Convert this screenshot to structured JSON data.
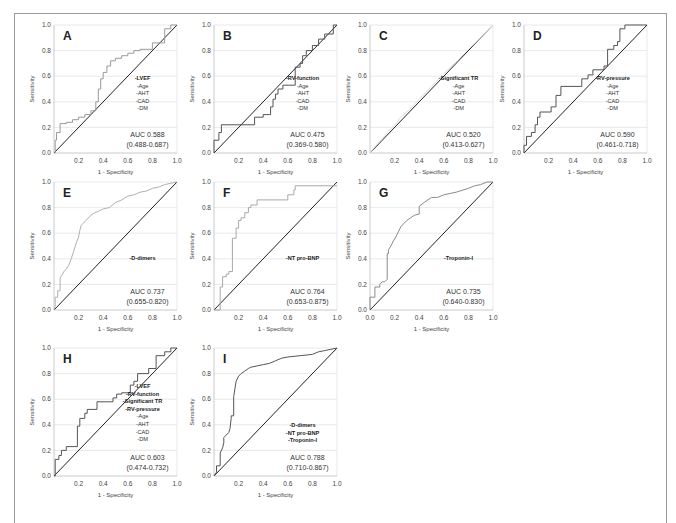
{
  "chart_data": [
    {
      "panel": "A",
      "type": "line",
      "xlabel": "1 - Specificity",
      "ylabel": "Sensitivity",
      "xticks": [
        "0.2",
        "0.4",
        "0.6",
        "0.8",
        "1.0"
      ],
      "yticks": [
        "0.0",
        "0.2",
        "0.4",
        "0.6",
        "0.8",
        "1.0"
      ],
      "xlim": [
        0,
        1
      ],
      "ylim": [
        0,
        1
      ],
      "grid": true,
      "legend": [
        {
          "text": "-LVEF",
          "bold": true
        },
        {
          "text": "-Age"
        },
        {
          "text": "-AHT"
        },
        {
          "text": "-CAD"
        },
        {
          "text": "-DM"
        }
      ],
      "auc": "AUC 0.588",
      "ci": "(0.488-0.687)",
      "curve_color": "#9a9a9a",
      "x": [
        0,
        0.01,
        0.01,
        0.02,
        0.02,
        0.05,
        0.05,
        0.1,
        0.1,
        0.15,
        0.15,
        0.2,
        0.2,
        0.25,
        0.25,
        0.3,
        0.3,
        0.34,
        0.34,
        0.36,
        0.36,
        0.38,
        0.38,
        0.4,
        0.4,
        0.43,
        0.43,
        0.46,
        0.46,
        0.5,
        0.5,
        0.55,
        0.55,
        0.6,
        0.6,
        0.65,
        0.65,
        0.7,
        0.7,
        0.8,
        0.8,
        0.9,
        0.9,
        0.95,
        0.95,
        1.0
      ],
      "y": [
        0,
        0,
        0.1,
        0.1,
        0.16,
        0.16,
        0.23,
        0.23,
        0.24,
        0.24,
        0.26,
        0.26,
        0.28,
        0.28,
        0.3,
        0.3,
        0.33,
        0.33,
        0.4,
        0.4,
        0.5,
        0.5,
        0.58,
        0.58,
        0.63,
        0.63,
        0.68,
        0.68,
        0.72,
        0.72,
        0.74,
        0.74,
        0.76,
        0.76,
        0.78,
        0.78,
        0.8,
        0.8,
        0.81,
        0.81,
        0.86,
        0.86,
        0.97,
        0.97,
        1.0,
        1.0
      ]
    },
    {
      "panel": "B",
      "type": "line",
      "xlabel": "1 - Specificity",
      "ylabel": "Sensitivity",
      "xticks": [
        "0.2",
        "0.4",
        "0.6",
        "0.8",
        "1.0"
      ],
      "yticks": [
        "0.0",
        "0.2",
        "0.4",
        "0.6",
        "0.8",
        "1.0"
      ],
      "xlim": [
        0,
        1
      ],
      "ylim": [
        0,
        1
      ],
      "grid": true,
      "legend": [
        {
          "text": "-RV-function",
          "bold": true
        },
        {
          "text": "-Age"
        },
        {
          "text": "-AHT"
        },
        {
          "text": "-CAD"
        },
        {
          "text": "-DM"
        }
      ],
      "auc": "AUC 0.475",
      "ci": "(0.369-0.580)",
      "curve_color": "#555555",
      "x": [
        0,
        0,
        0.04,
        0.04,
        0.06,
        0.06,
        0.33,
        0.33,
        0.4,
        0.4,
        0.46,
        0.46,
        0.48,
        0.48,
        0.5,
        0.5,
        0.52,
        0.52,
        0.56,
        0.56,
        0.66,
        0.66,
        0.7,
        0.7,
        0.72,
        0.72,
        0.75,
        0.75,
        0.8,
        0.8,
        0.85,
        0.85,
        0.9,
        0.9,
        0.97,
        0.97,
        1.0
      ],
      "y": [
        0,
        0.1,
        0.1,
        0.16,
        0.16,
        0.22,
        0.22,
        0.28,
        0.28,
        0.3,
        0.3,
        0.36,
        0.36,
        0.42,
        0.42,
        0.46,
        0.46,
        0.5,
        0.5,
        0.53,
        0.53,
        0.67,
        0.67,
        0.7,
        0.7,
        0.76,
        0.76,
        0.8,
        0.8,
        0.84,
        0.84,
        0.89,
        0.89,
        0.93,
        0.93,
        1.0,
        1.0
      ]
    },
    {
      "panel": "C",
      "type": "line",
      "xlabel": "1 - Specificity",
      "ylabel": "Sensitivity",
      "xticks": [
        "0.2",
        "0.4",
        "0.6",
        "0.8",
        "1.0"
      ],
      "yticks": [
        "0.0",
        "0.2",
        "0.4",
        "0.6",
        "0.8",
        "1.0"
      ],
      "xlim": [
        0,
        1
      ],
      "ylim": [
        0,
        1
      ],
      "grid": true,
      "legend": [
        {
          "text": "-Significant TR",
          "bold": true
        },
        {
          "text": "-Age"
        },
        {
          "text": "-AHT"
        },
        {
          "text": "-CAD"
        },
        {
          "text": "-DM"
        }
      ],
      "auc": "AUC 0.520",
      "ci": "(0.413-0.627)",
      "curve_color": "#dcdcdc",
      "x": [
        0,
        0.05,
        0.1,
        0.15,
        0.2,
        0.25,
        0.3,
        0.35,
        0.4,
        0.5,
        0.6,
        0.7,
        0.8,
        0.9,
        1.0
      ],
      "y": [
        0,
        0.06,
        0.11,
        0.17,
        0.22,
        0.28,
        0.32,
        0.37,
        0.42,
        0.52,
        0.62,
        0.71,
        0.81,
        0.9,
        1.0
      ]
    },
    {
      "panel": "D",
      "type": "line",
      "xlabel": "1 - Specificity",
      "ylabel": "Sensitivity",
      "xticks": [
        "0.2",
        "0.4",
        "0.6",
        "0.8",
        "1.0"
      ],
      "yticks": [
        "0.0",
        "0.2",
        "0.4",
        "0.6",
        "0.8",
        "1.0"
      ],
      "xlim": [
        0,
        1
      ],
      "ylim": [
        0,
        1
      ],
      "grid": true,
      "legend": [
        {
          "text": "-RV-pressure",
          "bold": true
        },
        {
          "text": "-Age"
        },
        {
          "text": "-AHT"
        },
        {
          "text": "-CAD"
        },
        {
          "text": "-DM"
        }
      ],
      "auc": "AUC 0.590",
      "ci": "(0.461-0.718)",
      "curve_color": "#555555",
      "x": [
        0,
        0,
        0.02,
        0.02,
        0.06,
        0.06,
        0.09,
        0.09,
        0.11,
        0.11,
        0.13,
        0.13,
        0.22,
        0.22,
        0.26,
        0.26,
        0.3,
        0.3,
        0.47,
        0.47,
        0.52,
        0.52,
        0.56,
        0.56,
        0.65,
        0.65,
        0.68,
        0.68,
        0.73,
        0.73,
        0.76,
        0.76,
        0.78,
        0.78,
        0.82,
        0.82,
        0.97,
        0.97,
        1.0
      ],
      "y": [
        0,
        0.06,
        0.06,
        0.13,
        0.13,
        0.16,
        0.16,
        0.22,
        0.22,
        0.28,
        0.28,
        0.32,
        0.32,
        0.36,
        0.36,
        0.45,
        0.45,
        0.52,
        0.52,
        0.58,
        0.58,
        0.61,
        0.61,
        0.65,
        0.65,
        0.68,
        0.68,
        0.81,
        0.81,
        0.84,
        0.84,
        0.87,
        0.87,
        0.97,
        0.97,
        1.0,
        1.0,
        1.0,
        1.0
      ]
    },
    {
      "panel": "E",
      "type": "line",
      "xlabel": "1 - Specificity",
      "ylabel": "Sensitivity",
      "xticks": [
        "0.2",
        "0.4",
        "0.6",
        "0.8",
        "1.0"
      ],
      "yticks": [
        "0.0",
        "0.2",
        "0.4",
        "0.6",
        "0.8",
        "1.0"
      ],
      "xlim": [
        0,
        1
      ],
      "ylim": [
        0,
        1
      ],
      "grid": true,
      "legend": [
        {
          "text": "-D-dimers",
          "bold": true
        }
      ],
      "auc": "AUC 0.737",
      "ci": "(0.655-0.820)",
      "curve_color": "#b0b0b0",
      "x": [
        0,
        0.01,
        0.01,
        0.03,
        0.03,
        0.05,
        0.05,
        0.07,
        0.08,
        0.1,
        0.12,
        0.14,
        0.16,
        0.18,
        0.2,
        0.21,
        0.22,
        0.24,
        0.26,
        0.3,
        0.33,
        0.36,
        0.4,
        0.45,
        0.5,
        0.55,
        0.6,
        0.65,
        0.7,
        0.75,
        0.8,
        0.85,
        0.9,
        0.95,
        1.0
      ],
      "y": [
        0,
        0.03,
        0.1,
        0.1,
        0.15,
        0.15,
        0.25,
        0.28,
        0.3,
        0.32,
        0.35,
        0.4,
        0.46,
        0.52,
        0.57,
        0.62,
        0.66,
        0.68,
        0.7,
        0.74,
        0.76,
        0.77,
        0.79,
        0.8,
        0.84,
        0.86,
        0.89,
        0.9,
        0.92,
        0.93,
        0.95,
        0.96,
        0.98,
        0.99,
        1.0
      ]
    },
    {
      "panel": "F",
      "type": "line",
      "xlabel": "1 - Specificity",
      "ylabel": "Sensitivity",
      "xticks": [
        "0.2",
        "0.4",
        "0.6",
        "0.8",
        "1.0"
      ],
      "yticks": [
        "0.0",
        "0.2",
        "0.4",
        "0.6",
        "0.8",
        "1.0"
      ],
      "xlim": [
        0,
        1
      ],
      "ylim": [
        0,
        1
      ],
      "grid": true,
      "legend": [
        {
          "text": "-NT pro-BNP",
          "bold": true
        }
      ],
      "auc": "AUC 0.764",
      "ci": "(0.653-0.875)",
      "curve_color": "#a8a8a8",
      "x": [
        0,
        0.05,
        0.05,
        0.07,
        0.07,
        0.1,
        0.1,
        0.12,
        0.12,
        0.15,
        0.15,
        0.18,
        0.18,
        0.2,
        0.2,
        0.22,
        0.22,
        0.25,
        0.25,
        0.28,
        0.28,
        0.3,
        0.3,
        0.35,
        0.35,
        0.6,
        0.6,
        0.65,
        0.65,
        0.66,
        0.66,
        1.0
      ],
      "y": [
        0,
        0,
        0.18,
        0.18,
        0.26,
        0.26,
        0.28,
        0.28,
        0.3,
        0.3,
        0.56,
        0.56,
        0.64,
        0.64,
        0.7,
        0.7,
        0.72,
        0.72,
        0.76,
        0.76,
        0.8,
        0.8,
        0.82,
        0.82,
        0.86,
        0.86,
        0.9,
        0.9,
        0.94,
        0.94,
        0.97,
        0.97
      ]
    },
    {
      "panel": "G",
      "type": "line",
      "xlabel": "1 - Specificity",
      "ylabel": "Sensitivity",
      "xticks": [
        "0.0",
        "0.2",
        "0.4",
        "0.6",
        "0.8",
        "1.0"
      ],
      "yticks": [
        "0.0",
        "0.2",
        "0.4",
        "0.6",
        "0.8",
        "1.0"
      ],
      "xlim": [
        0,
        1
      ],
      "ylim": [
        0,
        1
      ],
      "grid": true,
      "legend": [
        {
          "text": "-Troponin-I",
          "bold": true
        }
      ],
      "auc": "AUC 0.735",
      "ci": "(0.640-0.830)",
      "curve_color": "#8a8a8a",
      "x": [
        0,
        0,
        0.04,
        0.04,
        0.08,
        0.08,
        0.1,
        0.12,
        0.14,
        0.14,
        0.15,
        0.15,
        0.17,
        0.19,
        0.21,
        0.23,
        0.25,
        0.27,
        0.3,
        0.33,
        0.36,
        0.4,
        0.4,
        0.44,
        0.5,
        0.55,
        0.6,
        0.65,
        0.7,
        0.8,
        0.85,
        0.9,
        0.95,
        1.0
      ],
      "y": [
        0,
        0.1,
        0.1,
        0.18,
        0.18,
        0.2,
        0.22,
        0.22,
        0.24,
        0.44,
        0.44,
        0.47,
        0.5,
        0.54,
        0.57,
        0.61,
        0.65,
        0.67,
        0.7,
        0.72,
        0.74,
        0.75,
        0.81,
        0.84,
        0.88,
        0.88,
        0.9,
        0.91,
        0.92,
        0.95,
        0.97,
        0.98,
        1.0,
        1.0
      ]
    },
    {
      "panel": "H",
      "type": "line",
      "xlabel": "1 - Specificity",
      "ylabel": "Sensitivity",
      "xticks": [
        "0.2",
        "0.4",
        "0.6",
        "0.8",
        "1.0"
      ],
      "yticks": [
        "0.0",
        "0.2",
        "0.4",
        "0.6",
        "0.8",
        "1.0"
      ],
      "xlim": [
        0,
        1
      ],
      "ylim": [
        0,
        1
      ],
      "grid": true,
      "legend": [
        {
          "text": "-LVEF",
          "bold": true
        },
        {
          "text": "-RV-function",
          "bold": true
        },
        {
          "text": "-Significant TR",
          "bold": true
        },
        {
          "text": "-RV-pressure",
          "bold": true
        },
        {
          "text": "-Age"
        },
        {
          "text": "-AHT"
        },
        {
          "text": "-CAD"
        },
        {
          "text": "-DM"
        }
      ],
      "auc": "AUC 0.603",
      "ci": "(0.474-0.732)",
      "curve_color": "#555555",
      "x": [
        0,
        0.01,
        0.01,
        0.04,
        0.04,
        0.06,
        0.06,
        0.1,
        0.1,
        0.19,
        0.19,
        0.21,
        0.21,
        0.25,
        0.25,
        0.27,
        0.27,
        0.35,
        0.35,
        0.48,
        0.48,
        0.51,
        0.51,
        0.55,
        0.55,
        0.62,
        0.62,
        0.65,
        0.65,
        0.68,
        0.68,
        0.77,
        0.77,
        0.83,
        0.83,
        0.9,
        0.9,
        0.95,
        0.95,
        1.0
      ],
      "y": [
        0,
        0,
        0.13,
        0.13,
        0.16,
        0.16,
        0.2,
        0.2,
        0.23,
        0.23,
        0.39,
        0.39,
        0.45,
        0.45,
        0.49,
        0.49,
        0.52,
        0.52,
        0.58,
        0.58,
        0.61,
        0.61,
        0.64,
        0.64,
        0.65,
        0.65,
        0.71,
        0.71,
        0.74,
        0.74,
        0.8,
        0.8,
        0.84,
        0.84,
        0.94,
        0.94,
        0.97,
        0.97,
        1.0,
        1.0
      ]
    },
    {
      "panel": "I",
      "type": "line",
      "xlabel": "1 - Specificity",
      "ylabel": "Sensitivity",
      "xticks": [
        "0.2",
        "0.4",
        "0.6",
        "0.8",
        "1.0"
      ],
      "yticks": [
        "0.0",
        "0.2",
        "0.4",
        "0.6",
        "0.8",
        "1.0"
      ],
      "xlim": [
        0,
        1
      ],
      "ylim": [
        0,
        1
      ],
      "grid": true,
      "legend": [
        {
          "text": "-D-dimers",
          "bold": true
        },
        {
          "text": "-NT pro-BNP",
          "bold": true
        },
        {
          "text": "-Troponin-I",
          "bold": true
        }
      ],
      "auc": "AUC 0.788",
      "ci": "(0.710-0.867)",
      "curve_color": "#555555",
      "x": [
        0,
        0.02,
        0.02,
        0.05,
        0.05,
        0.07,
        0.08,
        0.08,
        0.1,
        0.12,
        0.13,
        0.14,
        0.14,
        0.16,
        0.16,
        0.17,
        0.18,
        0.2,
        0.22,
        0.25,
        0.28,
        0.3,
        0.35,
        0.4,
        0.45,
        0.5,
        0.55,
        0.6,
        0.7,
        0.8,
        0.85,
        0.9,
        0.95,
        1.0
      ],
      "y": [
        0,
        0.03,
        0.08,
        0.08,
        0.18,
        0.22,
        0.26,
        0.3,
        0.32,
        0.34,
        0.37,
        0.45,
        0.47,
        0.47,
        0.62,
        0.68,
        0.74,
        0.78,
        0.8,
        0.82,
        0.84,
        0.85,
        0.86,
        0.87,
        0.88,
        0.9,
        0.92,
        0.93,
        0.94,
        0.95,
        0.97,
        0.98,
        0.99,
        1.0
      ]
    }
  ]
}
